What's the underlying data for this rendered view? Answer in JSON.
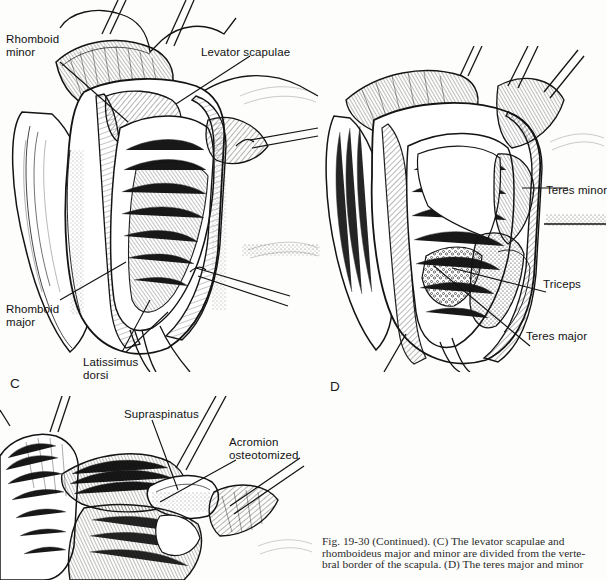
{
  "page": {
    "background_color": "#fdfdfb",
    "ink_color": "#111111"
  },
  "figure": {
    "number": "19-30",
    "prefix": "Fig.",
    "continued": "(Continued)",
    "caption_lines": [
      "Fig. 19-30 (Continued). (C) The levator scapulae and",
      "rhomboideus major and minor are divided from the verte-",
      "bral border of the scapula. (D) The teres major and minor"
    ],
    "caption_full": "Fig. 19-30 (Continued). (C) The levator scapulae and rhomboideus major and minor are divided from the vertebral border of the scapula. (D) The teres major and minor"
  },
  "panels": [
    {
      "id": "panel-a",
      "letter": "",
      "title": "posterior scapular dissection",
      "labels": [
        {
          "name": "rhomboid-minor",
          "text": "Rhomboid\nminor",
          "x": 6,
          "y": 33
        },
        {
          "name": "levator-scapulae",
          "text": "Levator scapulae",
          "x": 201,
          "y": 46
        },
        {
          "name": "rhomboid-major",
          "text": "Rhomboid\nmajor",
          "x": 6,
          "y": 303
        },
        {
          "name": "latissimus-dorsi",
          "text": "Latissimus\ndorsi",
          "x": 83,
          "y": 356
        }
      ]
    },
    {
      "id": "panel-d",
      "letter": "D",
      "letter_x": 330,
      "letter_y": 379,
      "title": "teres major and minor exposure",
      "labels": [
        {
          "name": "teres-minor",
          "text": "Teres minor",
          "x": 546,
          "y": 184
        },
        {
          "name": "triceps",
          "text": "Triceps",
          "x": 543,
          "y": 278
        },
        {
          "name": "teres-major",
          "text": "Teres major",
          "x": 526,
          "y": 330
        }
      ]
    },
    {
      "id": "panel-c",
      "letter": "C",
      "letter_x": 10,
      "letter_y": 376,
      "title": "supraspinatus and acromion osteotomy",
      "labels": [
        {
          "name": "supraspinatus",
          "text": "Supraspinatus",
          "x": 124,
          "y": 408
        },
        {
          "name": "acromion-osteotomized",
          "text": "Acromion\nosteotomized",
          "x": 229,
          "y": 436
        }
      ]
    }
  ],
  "anatomy_terms": [
    "Rhomboid minor",
    "Levator scapulae",
    "Rhomboid major",
    "Latissimus dorsi",
    "Teres minor",
    "Triceps",
    "Teres major",
    "Supraspinatus",
    "Acromion osteotomized"
  ]
}
